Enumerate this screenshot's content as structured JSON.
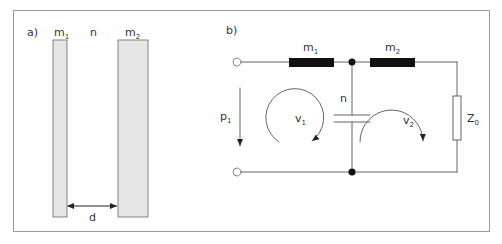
{
  "panel_a": {
    "label": "a)",
    "plate1": {
      "name": "m",
      "sub": "1"
    },
    "medium": "n",
    "plate2": {
      "name": "m",
      "sub": "2"
    },
    "distance": "d"
  },
  "panel_b": {
    "label": "b)",
    "mass1": {
      "name": "m",
      "sub": "1"
    },
    "mass2": {
      "name": "m",
      "sub": "2"
    },
    "compliance": "n",
    "pressure": {
      "name": "p",
      "sub": "1"
    },
    "velocity1": {
      "name": "v",
      "sub": "1"
    },
    "velocity2": {
      "name": "v",
      "sub": "2"
    },
    "impedance": {
      "name": "Z",
      "sub": "0"
    }
  },
  "colors": {
    "plate_fill": "#e6e6e6",
    "line": "#555555",
    "mass_fill": "#111111",
    "border": "#999999"
  }
}
